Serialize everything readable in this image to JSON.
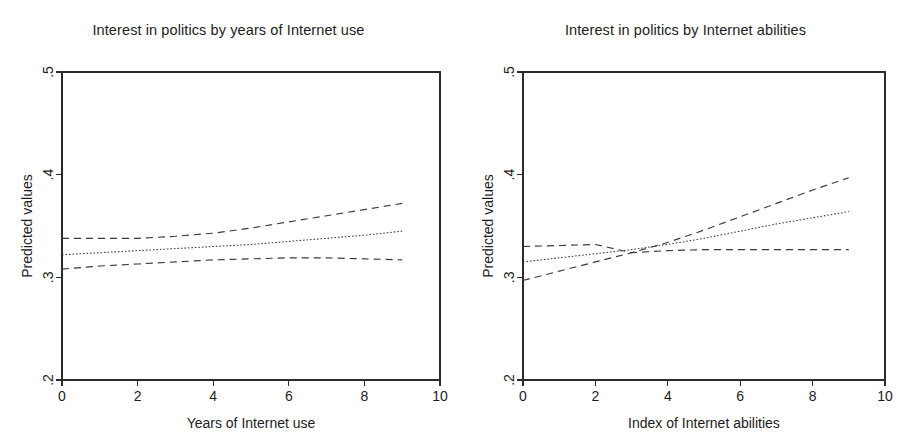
{
  "figure": {
    "width": 914,
    "height": 448,
    "background": "#ffffff",
    "line_color": "#3a3a3a",
    "axis_color": "#2b2b2b"
  },
  "panels": [
    {
      "id": "years-of-internet-use",
      "title": "Interest in politics by years of Internet use",
      "ylabel": "Predicted values",
      "xlabel": "Years of Internet use",
      "xticks": [
        "0",
        "2",
        "4",
        "6",
        "8",
        "10"
      ],
      "yticks": [
        ".2",
        ".3",
        ".4",
        ".5"
      ]
    },
    {
      "id": "internet-abilities",
      "title": "Interest in politics by Internet abilities",
      "ylabel": "Predicted values",
      "xlabel": "Index of Internet abilities",
      "xticks": [
        "0",
        "2",
        "4",
        "6",
        "8",
        "10"
      ],
      "yticks": [
        ".2",
        ".3",
        ".4",
        ".5"
      ]
    }
  ],
  "chart_data": [
    {
      "type": "line",
      "title": "Interest in politics by years of Internet use",
      "xlabel": "Years of Internet use",
      "ylabel": "Predicted values",
      "xlim": [
        0,
        10
      ],
      "ylim": [
        0.2,
        0.5
      ],
      "xticks": [
        0,
        2,
        4,
        6,
        8,
        10
      ],
      "yticks": [
        0.2,
        0.3,
        0.4,
        0.5
      ],
      "grid": false,
      "legend": "none",
      "x": [
        0,
        1,
        2,
        3,
        4,
        5,
        6,
        7,
        8,
        9
      ],
      "series": [
        {
          "name": "Upper confidence bound",
          "style": "dashed",
          "values": [
            0.338,
            0.338,
            0.338,
            0.34,
            0.343,
            0.348,
            0.354,
            0.36,
            0.366,
            0.372
          ]
        },
        {
          "name": "Predicted value (fit)",
          "style": "dotted",
          "values": [
            0.322,
            0.324,
            0.326,
            0.328,
            0.33,
            0.332,
            0.335,
            0.338,
            0.341,
            0.345
          ]
        },
        {
          "name": "Lower confidence bound",
          "style": "dashed",
          "values": [
            0.308,
            0.311,
            0.313,
            0.315,
            0.317,
            0.318,
            0.319,
            0.319,
            0.318,
            0.317
          ]
        }
      ]
    },
    {
      "type": "line",
      "title": "Interest in politics by Internet abilities",
      "xlabel": "Index of Internet abilities",
      "ylabel": "Predicted values",
      "xlim": [
        0,
        10
      ],
      "ylim": [
        0.2,
        0.5
      ],
      "xticks": [
        0,
        2,
        4,
        6,
        8,
        10
      ],
      "yticks": [
        0.2,
        0.3,
        0.4,
        0.5
      ],
      "grid": false,
      "legend": "none",
      "x": [
        0,
        1,
        2,
        3,
        4,
        5,
        6,
        7,
        8,
        9
      ],
      "series": [
        {
          "name": "Upper confidence bound",
          "style": "dashed",
          "values": [
            0.33,
            0.331,
            0.332,
            0.324,
            0.326,
            0.327,
            0.327,
            0.327,
            0.327,
            0.327
          ]
        },
        {
          "name": "Predicted value (fit)",
          "style": "dotted",
          "values": [
            0.315,
            0.319,
            0.323,
            0.327,
            0.332,
            0.338,
            0.345,
            0.352,
            0.358,
            0.364
          ]
        },
        {
          "name": "Lower confidence bound",
          "style": "dashed",
          "values": [
            0.297,
            0.306,
            0.315,
            0.324,
            0.334,
            0.346,
            0.359,
            0.372,
            0.385,
            0.397
          ]
        }
      ]
    }
  ]
}
